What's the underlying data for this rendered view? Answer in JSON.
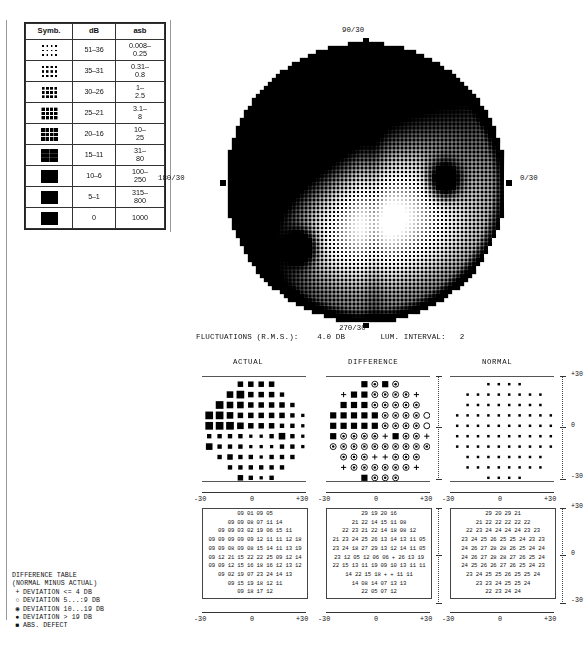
{
  "legend": {
    "headers": [
      "Symb.",
      "dB",
      "asb"
    ],
    "rows": [
      {
        "density": 0.1,
        "db": "51–36",
        "asb": "0.008–\n0.25"
      },
      {
        "density": 0.18,
        "db": "35–31",
        "asb": "0.31–\n0.8"
      },
      {
        "density": 0.28,
        "db": "30–26",
        "asb": "1–\n2.5"
      },
      {
        "density": 0.38,
        "db": "25–21",
        "asb": "3.1–\n8"
      },
      {
        "density": 0.5,
        "db": "20–16",
        "asb": "10–\n25"
      },
      {
        "density": 0.64,
        "db": "15–11",
        "asb": "31–\n80"
      },
      {
        "density": 0.78,
        "db": "10–6",
        "asb": "100–\n250"
      },
      {
        "density": 0.9,
        "db": "5–1",
        "asb": "315–\n800"
      },
      {
        "density": 1.0,
        "db": "0",
        "asb": "1000"
      }
    ]
  },
  "field": {
    "label_top": "90/30",
    "label_bottom": "270/30",
    "label_left": "180/30",
    "label_right": "0/30"
  },
  "status": {
    "fluctuations_label": "FLUCTUATIONS (R.M.S.):",
    "fluctuations_value": "4.0 DB",
    "lum_label": "LUM. INTERVAL:",
    "lum_value": "2"
  },
  "panels": {
    "actual_title": "ACTUAL",
    "difference_title": "DIFFERENCE",
    "normal_title": "NORMAL",
    "axis_y": [
      "+30",
      "0",
      "-30"
    ],
    "axis_x": [
      "-30",
      "0",
      "+30"
    ]
  },
  "difference_legend": {
    "title": "DIFFERENCE TABLE",
    "subtitle": "(NORMAL MINUS ACTUAL)",
    "entries": [
      {
        "glyph": "+",
        "text": "DEVIATION <= 4 DB"
      },
      {
        "glyph": "○",
        "text": "DEVIATION  5...:9 DB"
      },
      {
        "glyph": "◉",
        "text": "DEVIATION 10...19 DB"
      },
      {
        "glyph": "●",
        "text": "DEVIATION > 19 DB"
      },
      {
        "glyph": "■",
        "text": "ABS. DEFECT"
      }
    ]
  },
  "chart_data": {
    "type": "heatmap",
    "xlabel": "degrees",
    "ylabel": "degrees",
    "xlim": [
      -30,
      30
    ],
    "ylim": [
      -30,
      30
    ],
    "grid": false,
    "legend_position": "top-left",
    "units_db": "decibels",
    "actual_table": [
      [
        "09",
        "01",
        "09",
        "05"
      ],
      [
        "09",
        "09",
        "08",
        "07",
        "11",
        "14"
      ],
      [
        "09",
        "09",
        "03",
        "02",
        "19",
        "06",
        "15",
        "11"
      ],
      [
        "09",
        "09",
        "09",
        "09",
        "09",
        "12",
        "11",
        "11",
        "12",
        "18"
      ],
      [
        "09",
        "09",
        "08",
        "09",
        "08",
        "15",
        "14",
        "11",
        "13",
        "19"
      ],
      [
        "09",
        "12",
        "21",
        "15",
        "22",
        "22",
        "25",
        "09",
        "12",
        "14"
      ],
      [
        "09",
        "09",
        "12",
        "15",
        "16",
        "18",
        "16",
        "12",
        "13",
        "12"
      ],
      [
        "09",
        "02",
        "19",
        "07",
        "23",
        "24",
        "14",
        "13"
      ],
      [
        "09",
        "15",
        "19",
        "18",
        "12",
        "11"
      ],
      [
        "09",
        "18",
        "17",
        "12"
      ]
    ],
    "difference_table": [
      [
        "29",
        "19",
        "20",
        "16"
      ],
      [
        "21",
        "22",
        "14",
        "15",
        "11",
        "08"
      ],
      [
        "22",
        "23",
        "21",
        "22",
        "14",
        "18",
        "08",
        "12"
      ],
      [
        "21",
        "23",
        "24",
        "25",
        "26",
        "13",
        "14",
        "13",
        "11",
        "05"
      ],
      [
        "23",
        "24",
        "18",
        "27",
        "29",
        "13",
        "12",
        "14",
        "11",
        "05"
      ],
      [
        "23",
        "12",
        "05",
        "12",
        "06",
        "06",
        "+",
        "26",
        "13",
        "19"
      ],
      [
        "22",
        "15",
        "13",
        "11",
        "19",
        "09",
        "10",
        "13",
        "11",
        "11"
      ],
      [
        "14",
        "22",
        "15",
        "18",
        "+",
        "+",
        "11",
        "11"
      ],
      [
        "14",
        "08",
        "14",
        "07",
        "13",
        "13"
      ],
      [
        "22",
        "05",
        "07",
        "12"
      ]
    ],
    "normal_table": [
      [
        "29",
        "20",
        "29",
        "21"
      ],
      [
        "21",
        "22",
        "22",
        "22",
        "22",
        "22"
      ],
      [
        "22",
        "23",
        "24",
        "24",
        "24",
        "24",
        "23",
        "23"
      ],
      [
        "23",
        "24",
        "25",
        "26",
        "25",
        "25",
        "24",
        "23",
        "23"
      ],
      [
        "24",
        "26",
        "27",
        "28",
        "28",
        "26",
        "25",
        "24",
        "24"
      ],
      [
        "24",
        "26",
        "27",
        "28",
        "28",
        "27",
        "26",
        "25",
        "24"
      ],
      [
        "24",
        "25",
        "26",
        "26",
        "27",
        "26",
        "25",
        "24",
        "23"
      ],
      [
        "23",
        "24",
        "25",
        "25",
        "26",
        "25",
        "25",
        "24"
      ],
      [
        "23",
        "23",
        "24",
        "25",
        "25",
        "24"
      ],
      [
        "22",
        "23",
        "24",
        "24"
      ]
    ],
    "actual_symbol_sizes": [
      [
        0,
        0,
        0,
        5,
        5,
        5,
        5,
        0,
        0,
        0
      ],
      [
        0,
        0,
        6,
        7,
        5,
        5,
        5,
        4,
        0,
        0
      ],
      [
        0,
        7,
        6,
        6,
        5,
        5,
        5,
        5,
        4,
        0
      ],
      [
        7,
        7,
        6,
        5,
        5,
        5,
        5,
        5,
        4,
        3
      ],
      [
        7,
        7,
        7,
        6,
        5,
        5,
        5,
        4,
        4,
        3
      ],
      [
        4,
        4,
        4,
        4,
        3,
        3,
        4,
        6,
        4,
        3
      ],
      [
        6,
        4,
        4,
        4,
        3,
        3,
        3,
        4,
        4,
        3
      ],
      [
        0,
        4,
        5,
        4,
        4,
        3,
        4,
        4,
        4,
        0
      ],
      [
        0,
        0,
        4,
        4,
        4,
        4,
        4,
        4,
        0,
        0
      ],
      [
        0,
        0,
        0,
        5,
        4,
        3,
        4,
        0,
        0,
        0
      ]
    ],
    "difference_symbol_types": [
      [
        0,
        0,
        0,
        3,
        2,
        3,
        2,
        0,
        0,
        0
      ],
      [
        0,
        0,
        3,
        3,
        2,
        2,
        2,
        2,
        0,
        0
      ],
      [
        0,
        3,
        3,
        3,
        2,
        2,
        2,
        2,
        2,
        0
      ],
      [
        3,
        3,
        3,
        3,
        3,
        2,
        2,
        2,
        2,
        1
      ],
      [
        3,
        3,
        3,
        3,
        3,
        2,
        2,
        2,
        2,
        1
      ],
      [
        3,
        2,
        2,
        2,
        2,
        0,
        3,
        2,
        2,
        0
      ],
      [
        2,
        2,
        2,
        2,
        2,
        2,
        2,
        2,
        2,
        2
      ],
      [
        0,
        2,
        2,
        2,
        0,
        0,
        2,
        2,
        2,
        0
      ],
      [
        0,
        0,
        2,
        2,
        2,
        2,
        2,
        2,
        0,
        0
      ],
      [
        0,
        0,
        0,
        3,
        2,
        2,
        2,
        0,
        0,
        0
      ]
    ]
  }
}
